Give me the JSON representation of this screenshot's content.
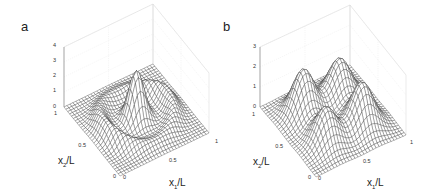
{
  "figure": {
    "panels": [
      {
        "label": "a",
        "z_ticks": [
          "0",
          "1",
          "2",
          "3",
          "4"
        ],
        "x1_ticks": [
          "0",
          "0.5",
          "1"
        ],
        "x2_ticks": [
          "0",
          "0.5",
          "1"
        ],
        "x1_label": "x",
        "x1_sub": "1",
        "x1_suffix": "/L",
        "x2_label": "x",
        "x2_sub": "2",
        "x2_suffix": "/L"
      },
      {
        "label": "b",
        "z_ticks": [
          "0",
          "1",
          "2",
          "3"
        ],
        "x1_ticks": [
          "0",
          "0.5",
          "1"
        ],
        "x2_ticks": [
          "0",
          "0.5",
          "1"
        ],
        "x1_label": "x",
        "x1_sub": "1",
        "x1_suffix": "/L",
        "x2_label": "x",
        "x2_sub": "2",
        "x2_suffix": "/L"
      }
    ]
  },
  "chart_data": [
    {
      "type": "surface",
      "title": "a",
      "xlabel": "x1/L",
      "ylabel": "x2/L",
      "zlabel": "",
      "xlim": [
        0,
        1
      ],
      "ylim": [
        0,
        1
      ],
      "zlim": [
        0,
        4
      ],
      "x_ticks": [
        0,
        0.5,
        1
      ],
      "y_ticks": [
        0,
        0.5,
        1
      ],
      "z_ticks": [
        0,
        1,
        2,
        3,
        4
      ],
      "grid": true,
      "description": "Wireframe mesh surface with one tall central peak (~3.3) near the middle and a curved ring/ridge of lower bumps (~1) around it",
      "features": [
        {
          "kind": "peak",
          "x1": 0.5,
          "x2": 0.5,
          "height": 3.3
        },
        {
          "kind": "ridge",
          "shape": "ring",
          "radius": 0.35,
          "height": 1.0
        }
      ]
    },
    {
      "type": "surface",
      "title": "b",
      "xlabel": "x1/L",
      "ylabel": "x2/L",
      "zlabel": "",
      "xlim": [
        0,
        1
      ],
      "ylim": [
        0,
        1
      ],
      "zlim": [
        0,
        3
      ],
      "x_ticks": [
        0,
        0.5,
        1
      ],
      "y_ticks": [
        0,
        0.5,
        1
      ],
      "z_ticks": [
        0,
        1,
        2,
        3
      ],
      "grid": true,
      "description": "Wireframe mesh surface with four Gaussian-like peaks arranged in a 2x2 pattern",
      "features": [
        {
          "kind": "peak",
          "x1": 0.3,
          "x2": 0.3,
          "height": 1.8
        },
        {
          "kind": "peak",
          "x1": 0.7,
          "x2": 0.3,
          "height": 2.2
        },
        {
          "kind": "peak",
          "x1": 0.3,
          "x2": 0.7,
          "height": 2.3
        },
        {
          "kind": "peak",
          "x1": 0.7,
          "x2": 0.7,
          "height": 2.0
        }
      ]
    }
  ]
}
